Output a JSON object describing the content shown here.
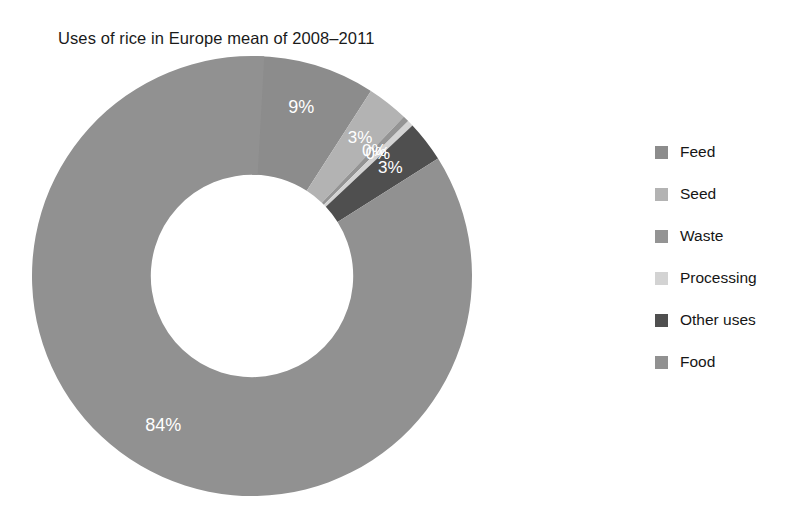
{
  "chart_data": {
    "type": "pie",
    "variant": "donut",
    "title": "Uses of rice in Europe mean of 2008–2011",
    "xlabel": "",
    "ylabel": "",
    "legend_position": "right",
    "grid": false,
    "hole_ratio": 0.46,
    "start_angle_deg": 0,
    "direction": "clockwise",
    "categories": [
      "Feed",
      "Seed",
      "Waste",
      "Processing",
      "Other uses",
      "Food"
    ],
    "values": [
      9,
      3,
      0,
      0,
      3,
      84
    ],
    "data_labels": [
      "9%",
      "3%",
      "0%",
      "0%",
      "3%",
      "84%"
    ],
    "colors": [
      "#8c8c8c",
      "#b3b3b3",
      "#949494",
      "#d3d3d3",
      "#4f4f4f",
      "#919191"
    ],
    "slices": [
      {
        "label": "Feed",
        "value": 9,
        "data_label": "9%",
        "color": "#8c8c8c"
      },
      {
        "label": "Seed",
        "value": 3,
        "data_label": "3%",
        "color": "#b3b3b3"
      },
      {
        "label": "Waste",
        "value": 0,
        "data_label": "0%",
        "color": "#949494"
      },
      {
        "label": "Processing",
        "value": 0,
        "data_label": "0%",
        "color": "#d3d3d3"
      },
      {
        "label": "Other uses",
        "value": 3,
        "data_label": "3%",
        "color": "#4f4f4f"
      },
      {
        "label": "Food",
        "value": 84,
        "data_label": "84%",
        "color": "#919191"
      }
    ]
  },
  "title": "Uses of rice in Europe mean of 2008–2011",
  "legend": {
    "items": [
      {
        "label": "Feed",
        "color": "#8c8c8c"
      },
      {
        "label": "Seed",
        "color": "#b3b3b3"
      },
      {
        "label": "Waste",
        "color": "#949494"
      },
      {
        "label": "Processing",
        "color": "#d3d3d3"
      },
      {
        "label": "Other uses",
        "color": "#4f4f4f"
      },
      {
        "label": "Food",
        "color": "#919191"
      }
    ]
  }
}
